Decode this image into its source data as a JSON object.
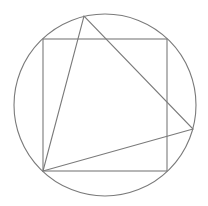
{
  "diagram": {
    "stroke_color": "#7a7a7a",
    "background": "#ffffff",
    "circle": {
      "cx": 105,
      "cy": 105,
      "r": 91
    },
    "square": {
      "x": 43,
      "y": 39,
      "width": 124,
      "height": 132
    },
    "triangle": {
      "points": "43,171 84,16 193,129"
    }
  }
}
